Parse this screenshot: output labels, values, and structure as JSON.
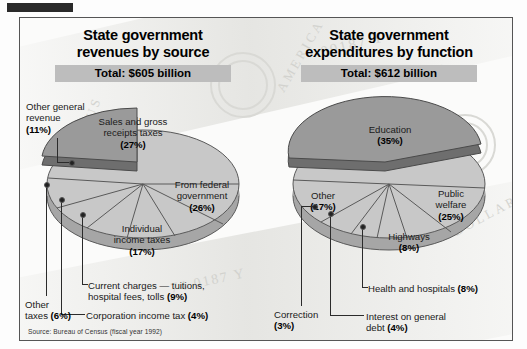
{
  "masthead": {
    "bar_label": ""
  },
  "panel": {
    "source_note": "Source: Bureau of Census (fiscal year 1992)"
  },
  "colors": {
    "exploded_slice": "#9a9a9a",
    "exploded_slice_side": "#6e6e6e",
    "slice": "#c8c8c8",
    "slice_side": "#a6a6a6",
    "slice_outline": "#5a5a5a",
    "banner_bg": "#bdbdbd",
    "frame": "#555555",
    "masthead": "#2a2a2a"
  },
  "left": {
    "title_line1": "State government",
    "title_line2": "revenues by source",
    "total": "Total: $605 billion",
    "labels": {
      "sales": "Sales and gross\nreceipts taxes\n(27%)",
      "federal": "From federal\ngovernment\n(26%)",
      "individual": "Individual\nincome taxes\n(17%)",
      "other_general": "Other general\nrevenue\n(11%)",
      "current_charges": "Current charges — tuitions,\nhospital fees, tolls (9%)",
      "other_taxes": "Other\ntaxes (6%)",
      "corporation": "Corporation income tax (4%)"
    }
  },
  "right": {
    "title_line1": "State government",
    "title_line2": "expenditures by function",
    "total": "Total: $612 billion",
    "labels": {
      "education": "Education\n(35%)",
      "public_welfare": "Public\nwelfare\n(25%)",
      "other": "Other\n(17%)",
      "highways": "Highways\n(8%)",
      "health": "Health and hospitals (8%)",
      "interest": "Interest on general\ndebt (4%)",
      "correction": "Correction\n(3%)"
    }
  },
  "chart_data": [
    {
      "type": "pie",
      "title": "State government revenues by source",
      "subtitle": "Total: $605 billion",
      "total_label": "$605 billion",
      "source": "Bureau of Census (fiscal year 1992)",
      "unit": "percent",
      "exploded": [
        "Sales and gross receipts taxes"
      ],
      "legend": "labels-on-slices-and-leaders",
      "categories": [
        "Sales and gross receipts taxes",
        "From federal government",
        "Individual income taxes",
        "Current charges — tuitions, hospital fees, tolls",
        "Corporation income tax",
        "Other taxes",
        "Other general revenue"
      ],
      "values": [
        27,
        26,
        17,
        9,
        4,
        6,
        11
      ]
    },
    {
      "type": "pie",
      "title": "State government expenditures by function",
      "subtitle": "Total: $612 billion",
      "total_label": "$612 billion",
      "source": "Bureau of Census (fiscal year 1992)",
      "unit": "percent",
      "exploded": [
        "Education"
      ],
      "legend": "labels-on-slices-and-leaders",
      "categories": [
        "Education",
        "Public welfare",
        "Highways",
        "Health and hospitals",
        "Interest on general debt",
        "Correction",
        "Other"
      ],
      "values": [
        35,
        25,
        8,
        8,
        4,
        3,
        17
      ]
    }
  ]
}
